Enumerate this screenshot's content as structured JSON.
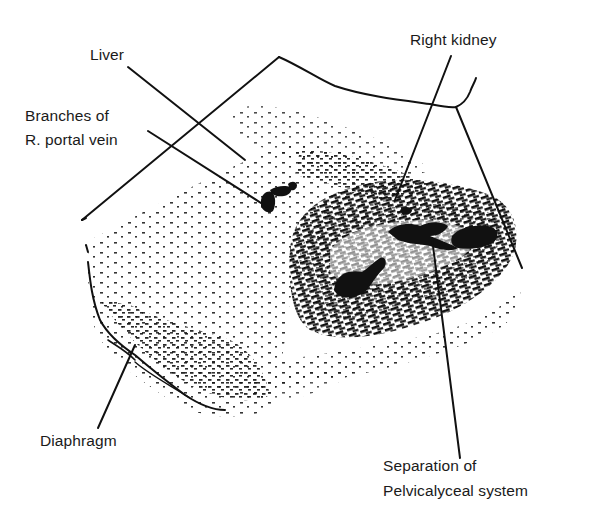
{
  "figure": {
    "type": "ultrasound-line-drawing",
    "colors": {
      "ink": "#111111",
      "background": "#ffffff",
      "label_text": "#1a1a1a"
    },
    "labels": [
      {
        "id": "liver",
        "lines": [
          "Liver"
        ],
        "x": 90,
        "y": 46
      },
      {
        "id": "portal-vein",
        "lines": [
          "Branches of",
          "R. portal vein"
        ],
        "x": 25,
        "y": 107
      },
      {
        "id": "right-kidney",
        "lines": [
          "Right kidney"
        ],
        "x": 410,
        "y": 31
      },
      {
        "id": "diaphragm",
        "lines": [
          "Diaphragm"
        ],
        "x": 40,
        "y": 432
      },
      {
        "id": "pelvicalyceal",
        "lines": [
          "Separation of",
          "Pelvicalyceal system"
        ],
        "x": 383,
        "y": 457
      }
    ],
    "leader_lines": [
      {
        "for": "liver",
        "x1": 128,
        "y1": 67,
        "x2": 245,
        "y2": 160
      },
      {
        "for": "portal-vein",
        "x1": 148,
        "y1": 131,
        "x2": 272,
        "y2": 210
      },
      {
        "for": "right-kidney",
        "x1": 451,
        "y1": 56,
        "x2": 395,
        "y2": 200
      },
      {
        "for": "diaphragm",
        "x1": 98,
        "y1": 428,
        "x2": 135,
        "y2": 345
      },
      {
        "for": "pelvicalyceal",
        "x1": 460,
        "y1": 458,
        "x2": 432,
        "y2": 238
      }
    ]
  }
}
